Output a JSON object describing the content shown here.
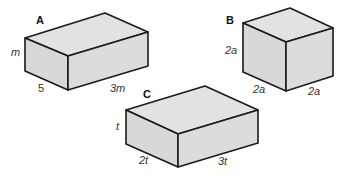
{
  "boxes": [
    {
      "label": "A",
      "height_label": "m",
      "depth_label": "5",
      "width_label": "3m"
    },
    {
      "label": "B",
      "height_label": "2a",
      "depth_label": "2a",
      "width_label": "2a"
    },
    {
      "label": "C",
      "height_label": "t",
      "depth_label": "2t",
      "width_label": "3t"
    }
  ],
  "colors": {
    "face": "#dcdcdc",
    "edge": "#1a1a1a",
    "background": "#ffffff"
  }
}
